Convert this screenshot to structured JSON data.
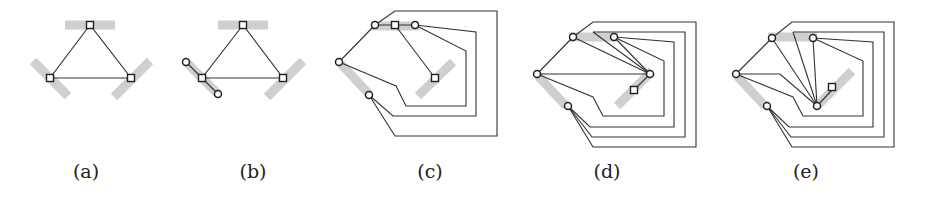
{
  "figure": {
    "panels": [
      {
        "id": "a",
        "label": "(a)",
        "label_x": 86
      },
      {
        "id": "b",
        "label": "(b)",
        "label_x": 253
      },
      {
        "id": "c",
        "label": "(c)",
        "label_x": 430
      },
      {
        "id": "d",
        "label": "(d)",
        "label_x": 607
      },
      {
        "id": "e",
        "label": "(e)",
        "label_x": 806
      }
    ]
  },
  "colors": {
    "bar": "#cfcfcf",
    "edge": "#333333",
    "vertex_stroke": "#222222",
    "vertex_fill": "#ffffff"
  },
  "legend": {
    "square_vertex": "square-vertex",
    "circle_vertex": "circle-vertex",
    "gray_bar": "gray-segment"
  }
}
